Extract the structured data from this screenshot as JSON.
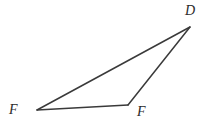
{
  "figure": {
    "kind": "geometry-triangle",
    "background_color": "#ffffff",
    "stroke_color": "#3a3a3a",
    "stroke_width": 1.5,
    "fill": "none",
    "canvas": {
      "width": 205,
      "height": 122
    },
    "vertices": [
      {
        "id": "d",
        "label": "D",
        "x": 190,
        "y": 27,
        "label_x": 185,
        "label_y": 4
      },
      {
        "id": "f1",
        "label": "F",
        "x": 37,
        "y": 110,
        "label_x": 9,
        "label_y": 103
      },
      {
        "id": "f2",
        "label": "F",
        "x": 128,
        "y": 105,
        "label_x": 137,
        "label_y": 105
      }
    ],
    "edges": [
      {
        "id": "edge-f1-d",
        "from": "f1",
        "to": "d"
      },
      {
        "id": "edge-d-f2",
        "from": "d",
        "to": "f2"
      },
      {
        "id": "edge-f2-f1",
        "from": "f2",
        "to": "f1"
      }
    ],
    "polygon_points": "37,110 190,27 128,105"
  }
}
